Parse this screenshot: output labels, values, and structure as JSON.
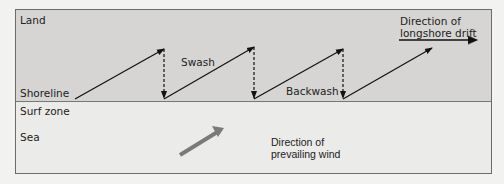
{
  "diagram": {
    "title": "Longshore drift",
    "zones": {
      "land": "Land",
      "shoreline": "Shoreline",
      "surf_zone": "Surf zone",
      "sea": "Sea"
    },
    "labels": {
      "swash": "Swash",
      "backwash": "Backwash",
      "longshore_line1": "Direction of",
      "longshore_line2": "longshore drift",
      "wind_line1": "Direction of",
      "wind_line2": "prevailing wind"
    },
    "colors": {
      "land": "#d6d5d3",
      "sea": "#ebebe9",
      "border": "#6c6c6c",
      "arrow": "#111111",
      "wind_arrow": "#7a7a7a"
    },
    "arrows": {
      "swash_count": 4,
      "backwash_count": 3
    }
  }
}
